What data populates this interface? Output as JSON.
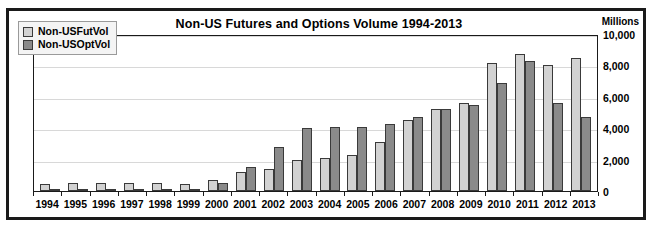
{
  "chart_data": {
    "type": "bar",
    "title": "Non-US Futures and Options Volume 1994-2013",
    "units_label": "Millions",
    "xlabel": "",
    "ylabel": "",
    "ylim": [
      0,
      10000
    ],
    "yticks": [
      "10,000",
      "8,000",
      "6,000",
      "4,000",
      "2,000",
      "0"
    ],
    "ytick_values": [
      10000,
      8000,
      6000,
      4000,
      2000,
      0
    ],
    "grid": true,
    "legend_position": "top-left",
    "categories": [
      "1994",
      "1995",
      "1996",
      "1997",
      "1998",
      "1999",
      "2000",
      "2001",
      "2002",
      "2003",
      "2004",
      "2005",
      "2006",
      "2007",
      "2008",
      "2009",
      "2010",
      "2011",
      "2012",
      "2013"
    ],
    "series": [
      {
        "name": "Non-USFutVol",
        "color": "#d2d2d2",
        "values": [
          450,
          500,
          500,
          520,
          480,
          450,
          700,
          1200,
          1400,
          1950,
          2100,
          2300,
          3150,
          4500,
          5200,
          5600,
          8150,
          8700,
          8000,
          8450
        ]
      },
      {
        "name": "Non-USOptVol",
        "color": "#8a8a8a",
        "values": [
          120,
          150,
          130,
          150,
          140,
          160,
          500,
          1500,
          2800,
          4000,
          4050,
          4100,
          4250,
          4700,
          5200,
          5500,
          6900,
          8300,
          5600,
          4700
        ]
      }
    ]
  }
}
